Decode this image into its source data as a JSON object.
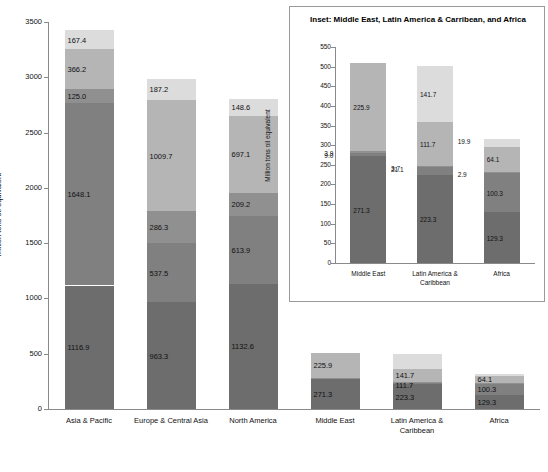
{
  "chart_data": [
    {
      "id": "main",
      "type": "bar",
      "stacked": true,
      "title": "",
      "xlabel": "",
      "ylabel": "Million tons oil equivalent",
      "ylim": [
        0,
        3500
      ],
      "ytick_step": 500,
      "yticks": [
        "0",
        "500",
        "1000",
        "1500",
        "2000",
        "2500",
        "3000",
        "3500"
      ],
      "grid": false,
      "legend": "none",
      "categories": [
        "Asia & Pacific",
        "Europe & Central Asia",
        "North America",
        "Middle East",
        "Latin America & Caribbean",
        "Africa"
      ],
      "series": [
        {
          "name": "s1",
          "color": "#6d6d6d",
          "values": [
            1116.9,
            963.3,
            1132.6,
            271.3,
            223.3,
            129.3
          ]
        },
        {
          "name": "s2",
          "color": "#808080",
          "values": [
            1648.1,
            537.5,
            613.9,
            9.0,
            21.1,
            100.3
          ]
        },
        {
          "name": "s3",
          "color": "#909090",
          "values": [
            125.0,
            286.3,
            209.2,
            3.9,
            3.7,
            2.9
          ]
        },
        {
          "name": "s4",
          "color": "#b5b5b5",
          "values": [
            366.2,
            1009.7,
            697.1,
            225.9,
            111.7,
            64.1
          ]
        },
        {
          "name": "s5",
          "color": "#dcdcdc",
          "values": [
            167.4,
            187.2,
            148.6,
            0.0,
            141.7,
            19.9
          ]
        }
      ],
      "visible_labels": [
        [
          "1116.9",
          "1648.1",
          "125.0",
          "366.2",
          "167.4"
        ],
        [
          "963.3",
          "537.5",
          "286.3",
          "1009.7",
          "187.2"
        ],
        [
          "1132.6",
          "613.9",
          "209.2",
          "697.1",
          "148.6"
        ],
        [
          "271.3",
          "",
          "",
          "225.9",
          ""
        ],
        [
          "223.3",
          "",
          "111.7",
          "141.7",
          ""
        ],
        [
          "129.3",
          "100.3",
          "",
          "64.1",
          ""
        ]
      ],
      "totals": [
        3423.6,
        2984.0,
        2801.4,
        510.1,
        501.5,
        316.5
      ]
    },
    {
      "id": "inset",
      "type": "bar",
      "stacked": true,
      "title": "Inset: Middle East, Latin America & Carribean, and Africa",
      "xlabel": "",
      "ylabel": "Million tons oil equivalent",
      "ylim": [
        0,
        550
      ],
      "ytick_step": 50,
      "yticks": [
        "0",
        "50",
        "100",
        "150",
        "200",
        "250",
        "300",
        "350",
        "400",
        "450",
        "500",
        "550"
      ],
      "grid": false,
      "legend": "none",
      "categories": [
        "Middle East",
        "Latin America & Caribbean",
        "Africa"
      ],
      "series": [
        {
          "name": "s1",
          "color": "#6d6d6d",
          "values": [
            271.3,
            223.3,
            129.3
          ]
        },
        {
          "name": "s2",
          "color": "#808080",
          "values": [
            9.0,
            21.1,
            100.3
          ]
        },
        {
          "name": "s3",
          "color": "#909090",
          "values": [
            3.9,
            3.7,
            2.9
          ]
        },
        {
          "name": "s4",
          "color": "#b5b5b5",
          "values": [
            225.9,
            111.7,
            64.1
          ]
        },
        {
          "name": "s5",
          "color": "#dcdcdc",
          "values": [
            0.0,
            141.7,
            19.9
          ]
        }
      ],
      "visible_labels": [
        [
          "271.3",
          "9.0",
          "3.9",
          "225.9",
          ""
        ],
        [
          "223.3",
          "21.1",
          "3.7",
          "111.7",
          "141.7"
        ],
        [
          "129.3",
          "100.3",
          "2.9",
          "64.1",
          "19.9"
        ]
      ],
      "totals": [
        510.1,
        501.5,
        316.5
      ]
    }
  ]
}
